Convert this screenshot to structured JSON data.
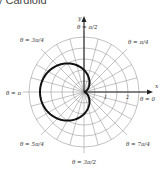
{
  "title": "y Cardioid",
  "diagram": {
    "type": "polar-graph",
    "curve": "r = 1 - cos θ",
    "origin": [
      84,
      92
    ],
    "unit_px": 22,
    "ring_radii_px": [
      11,
      22,
      33,
      44,
      55
    ],
    "radial_step_deg": 15,
    "colors": {
      "grid": "#9a9a9a",
      "curve": "#111111",
      "axis": "#222222"
    },
    "axis_labels": {
      "x": "x",
      "y": "y"
    },
    "tick_labels": [
      "1",
      "2"
    ],
    "angle_labels": {
      "zero": "θ = 0",
      "pi_over_4": "θ = π/4",
      "pi_over_2": "θ = π/2",
      "three_pi_over_4": "θ = 3π/4",
      "pi": "θ = π",
      "five_pi_over_4": "θ = 5π/4",
      "three_pi_over_2": "θ = 3π/2",
      "seven_pi_over_4": "θ = 7π/4"
    }
  }
}
